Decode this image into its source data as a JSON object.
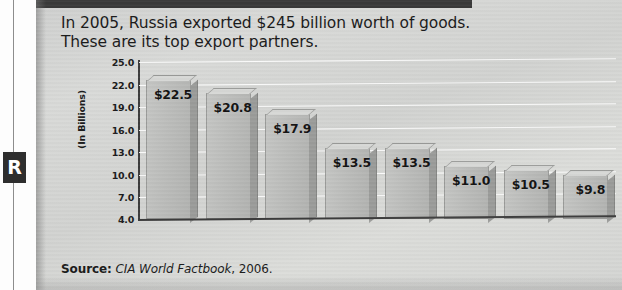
{
  "margin": {
    "badge_letter": "R"
  },
  "headline": {
    "line1": "In 2005, Russia exported $245 billion worth of goods.",
    "line2": "These are its top export partners."
  },
  "source": {
    "label": "Source:",
    "publication": "CIA World Factbook",
    "year": ", 2006."
  },
  "chart_data": {
    "type": "bar",
    "title": "In 2005, Russia exported $245 billion worth of goods. These are its top export partners.",
    "subtitle": "",
    "xlabel": "",
    "ylabel": "(In Billions)",
    "ylim": [
      4.0,
      25.0
    ],
    "yticks": [
      "25.0",
      "22.0",
      "19.0",
      "16.0",
      "13.0",
      "10.0",
      "7.0",
      "4.0"
    ],
    "ytick_values": [
      25.0,
      22.0,
      19.0,
      16.0,
      13.0,
      10.0,
      7.0,
      4.0
    ],
    "grid": true,
    "legend": "none",
    "categories": [
      "Nether-\nlands",
      "Germany",
      "Italy",
      "Ukraine",
      "China",
      "Turkey",
      "Switzer-\nland",
      "United\nStates"
    ],
    "values": [
      22.5,
      20.8,
      17.9,
      13.5,
      13.5,
      11.0,
      10.5,
      9.8
    ],
    "data_labels": [
      "$22.5",
      "$20.8",
      "$17.9",
      "$13.5",
      "$13.5",
      "$11.0",
      "$10.5",
      "$9.8"
    ],
    "bars": [
      {
        "category_l1": "Nether-",
        "category_l2": "lands",
        "value": 22.5,
        "label": "$22.5"
      },
      {
        "category_l1": "Germany",
        "category_l2": "",
        "value": 20.8,
        "label": "$20.8"
      },
      {
        "category_l1": "Italy",
        "category_l2": "",
        "value": 17.9,
        "label": "$17.9"
      },
      {
        "category_l1": "Ukraine",
        "category_l2": "",
        "value": 13.5,
        "label": "$13.5"
      },
      {
        "category_l1": "China",
        "category_l2": "",
        "value": 13.5,
        "label": "$13.5"
      },
      {
        "category_l1": "Turkey",
        "category_l2": "",
        "value": 11.0,
        "label": "$11.0"
      },
      {
        "category_l1": "Switzer-",
        "category_l2": "land",
        "value": 10.5,
        "label": "$10.5"
      },
      {
        "category_l1": "United",
        "category_l2": "States",
        "value": 9.8,
        "label": "$9.8"
      }
    ],
    "colors": {
      "bar_face": "#bcbdbb",
      "bar_side": "#9b9c9a",
      "bar_top": "#d7d8d6",
      "axis": "#3c3c3c",
      "gridline": "#ffffff",
      "panel": "#d5d6d4",
      "text": "#1b1b1b"
    }
  }
}
